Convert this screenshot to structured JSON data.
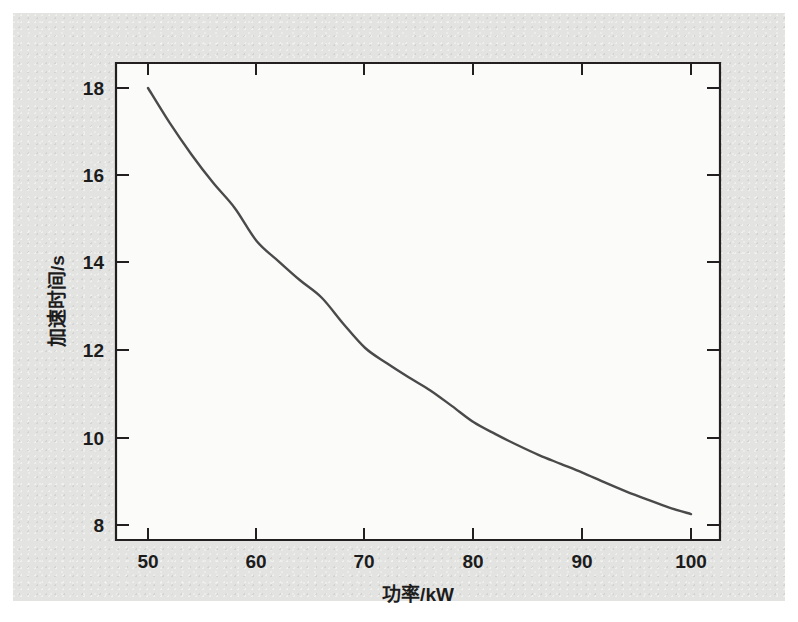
{
  "figure": {
    "background_color": "#e3e3e1",
    "plot_area_color": "#fbfbfa",
    "axis_color": "#231f20",
    "curve_color": "#4a4a4a"
  },
  "chart_data": {
    "type": "line",
    "title": "",
    "xlabel": "功率/kW",
    "ylabel": "加速时间/s",
    "xlim": [
      48.5,
      102.5
    ],
    "ylim": [
      7.4,
      18.6
    ],
    "xticks": [
      50,
      60,
      70,
      80,
      90,
      100
    ],
    "xtick_labels": [
      "50",
      "60",
      "70",
      "80",
      "90",
      "100"
    ],
    "yticks": [
      8,
      10,
      12,
      14,
      16,
      18
    ],
    "ytick_labels": [
      "8",
      "10",
      "12",
      "14",
      "16",
      "18"
    ],
    "grid": false,
    "legend": null,
    "series": [
      {
        "name": "加速时间",
        "x": [
          50,
          52,
          54,
          56,
          58,
          60,
          62,
          64,
          66,
          68,
          70,
          72,
          74,
          76,
          78,
          80,
          82,
          84,
          86,
          88,
          90,
          92,
          94,
          96,
          98,
          100
        ],
        "values": [
          18.0,
          17.2,
          16.48,
          15.83,
          15.25,
          14.5,
          14.04,
          13.6,
          13.2,
          12.6,
          12.05,
          11.7,
          11.38,
          11.08,
          10.72,
          10.35,
          10.08,
          9.83,
          9.6,
          9.4,
          9.2,
          8.98,
          8.77,
          8.58,
          8.4,
          8.25
        ]
      }
    ],
    "annotations": []
  }
}
